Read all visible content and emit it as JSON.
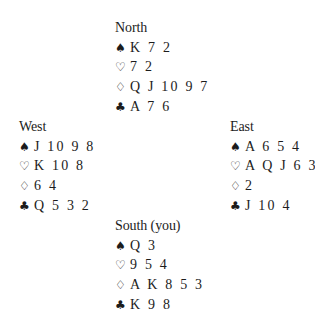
{
  "suit_symbols": {
    "spades": "♠",
    "hearts": "♡",
    "diamonds": "♢",
    "clubs": "♣"
  },
  "hands": {
    "north": {
      "title": "North",
      "spades": "K 7 2",
      "hearts": "7 2",
      "diamonds": "Q J 10 9 7",
      "clubs": "A 7 6"
    },
    "west": {
      "title": "West",
      "spades": "J 10 9 8",
      "hearts": "K 10 8",
      "diamonds": "6 4",
      "clubs": "Q 5 3 2"
    },
    "east": {
      "title": "East",
      "spades": "A 6 5 4",
      "hearts": "A Q J 6 3",
      "diamonds": "2",
      "clubs": "J 10 4"
    },
    "south": {
      "title": "South (you)",
      "spades": "Q 3",
      "hearts": "9 5 4",
      "diamonds": "A K 8 5 3",
      "clubs": "K 9 8"
    }
  }
}
